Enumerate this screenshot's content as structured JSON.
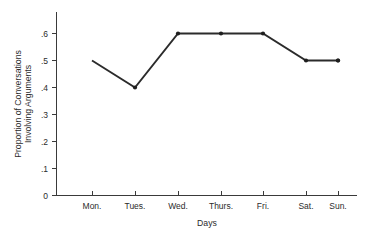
{
  "chart_data": {
    "type": "line",
    "title": "",
    "xlabel": "Days",
    "ylabel": "Proportion of Conversations Involving Arguments",
    "ylabel_lines": [
      "Proportion of Conversations",
      "Involving Arguments"
    ],
    "categories": [
      "Mon.",
      "Tues.",
      "Wed.",
      "Thurs.",
      "Fri.",
      "Sat.",
      "Sun."
    ],
    "values": [
      0.5,
      0.4,
      0.6,
      0.6,
      0.6,
      0.5,
      0.5
    ],
    "point_labels": [
      ".5",
      ".4",
      ".6",
      ".6",
      ".6",
      ".5",
      ".5"
    ],
    "ylim": [
      0,
      0.6
    ],
    "ytick_values": [
      0,
      0.1,
      0.2,
      0.3,
      0.4,
      0.5,
      0.6
    ],
    "ytick_labels": [
      "0",
      ".1",
      ".2",
      ".3",
      ".4",
      ".5",
      ".6"
    ],
    "grid": false,
    "legend": false,
    "legend_position": "none",
    "marker": "filled-circle",
    "line_color": "#2b2b2b",
    "marker_color": "#1f1f1f",
    "axis_color": "#3a3a3a",
    "background_color": "#ffffff"
  },
  "axes": {
    "y_axis_name": "y-axis",
    "x_axis_name": "x-axis"
  }
}
